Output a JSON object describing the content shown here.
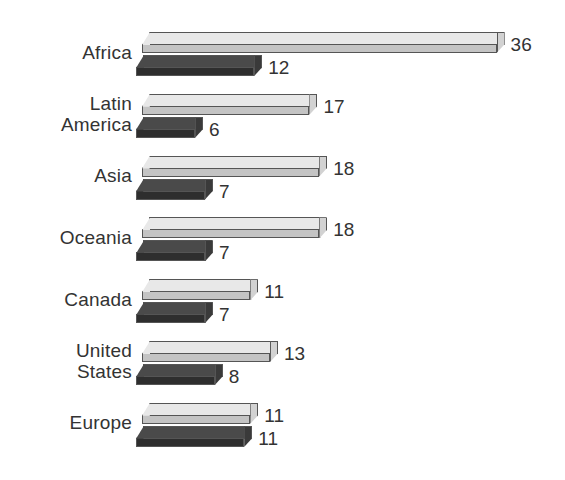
{
  "chart_data": {
    "type": "bar",
    "orientation": "horizontal",
    "title": "",
    "subtitle": "",
    "xlabel": "",
    "ylabel": "",
    "grid": false,
    "axes_visible": false,
    "legend": false,
    "legend_position": "none",
    "style": "3d-bars",
    "categories": [
      "Africa",
      "Latin\nAmerica",
      "Asia",
      "Oceania",
      "Canada",
      "United\nStates",
      "Europe"
    ],
    "series": [
      {
        "name": "light",
        "color": "#e8e8e8",
        "values": [
          36,
          17,
          18,
          18,
          11,
          13,
          11
        ]
      },
      {
        "name": "dark",
        "color": "#4a4a4a",
        "values": [
          12,
          6,
          7,
          7,
          7,
          8,
          11
        ]
      }
    ],
    "xlim": [
      0,
      36
    ],
    "value_labels": {
      "light": [
        "36",
        "17",
        "18",
        "18",
        "11",
        "13",
        "11"
      ],
      "dark": [
        "12",
        "6",
        "7",
        "7",
        "7",
        "8",
        "11"
      ]
    }
  },
  "colors": {
    "background": "#ffffff",
    "text": "#333333",
    "light_bar_top": "#e8e8e8",
    "light_bar_front": "#c4c4c4",
    "dark_bar_top": "#4a4a4a",
    "dark_bar_front": "#2e2e2e",
    "bar_outline": "#555555"
  }
}
